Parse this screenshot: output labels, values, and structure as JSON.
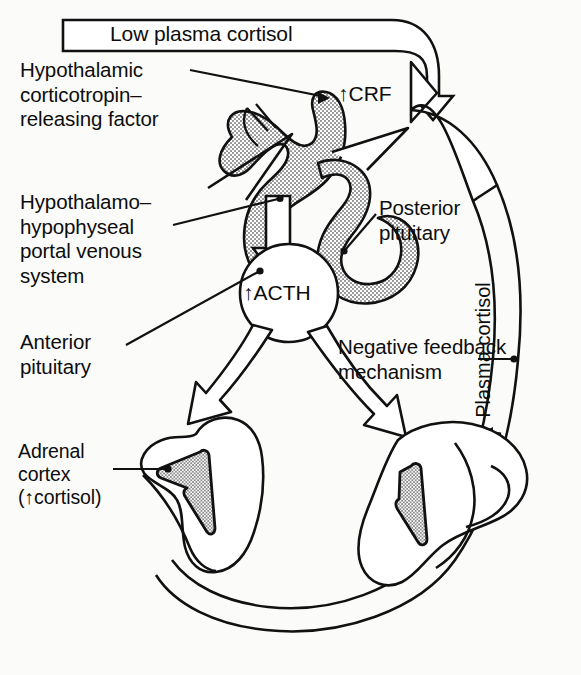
{
  "figure": {
    "background_color": "#fbfbf9",
    "ink_color": "#111111",
    "stipple_fill_color": "#c8c8c8"
  },
  "banner": {
    "text": "Low plasma cortisol",
    "shape": "open-rectangle-into-hollow-arrow",
    "points_to": "CRF"
  },
  "labels": {
    "hypothalamic_crf": "Hypothalamic\ncorticotropin–\nreleasing factor",
    "portal_system": "Hypothalamo–\nhypophyseal\nportal venous\nsystem",
    "anterior_pituitary": "Anterior\npituitary",
    "posterior_pituitary": "Posterior\npituitary",
    "adrenal_cortex": "Adrenal\ncortex\n(↑cortisol)",
    "negative_feedback": "Negative feedback\nmechanism",
    "plasma_cortisol": "Plasma cortisol"
  },
  "inline_labels": {
    "crf": "↑CRF",
    "acth": "↑ACTH"
  },
  "structures": [
    {
      "name": "hypothalamus",
      "fill": "stipple-gray",
      "note": "upper branching gray stippled structure"
    },
    {
      "name": "posterior-pituitary",
      "fill": "stipple-gray",
      "note": "gray stippled lobe right of anterior pituitary"
    },
    {
      "name": "anterior-pituitary",
      "fill": "white",
      "note": "white circle containing the ACTH label"
    },
    {
      "name": "adrenal-gland-left",
      "fill": "white",
      "note": "contains stippled triangular cortex"
    },
    {
      "name": "adrenal-gland-right",
      "fill": "white",
      "note": "contains stippled triangular cortex"
    }
  ],
  "arrows": [
    {
      "name": "low-cortisol-to-crf",
      "style": "hollow",
      "from": "banner",
      "to": "CRF"
    },
    {
      "name": "feedback-return-arrow",
      "style": "hollow-curved",
      "from": "plasma-cortisol-band",
      "to": "CRF"
    },
    {
      "name": "crf-to-anterior-pituitary",
      "style": "hollow",
      "from": "hypothalamus",
      "to": "anterior pituitary"
    },
    {
      "name": "acth-to-left-adrenal",
      "style": "hollow",
      "from": "anterior pituitary",
      "to": "left adrenal"
    },
    {
      "name": "acth-to-right-adrenal",
      "style": "hollow",
      "from": "anterior pituitary",
      "to": "right adrenal"
    },
    {
      "name": "plasma-cortisol-flow-arrow",
      "style": "solid-small",
      "direction": "up-along-band"
    }
  ],
  "leader_lines": [
    {
      "name": "leader-hypothalamic",
      "to": "hypothalamus"
    },
    {
      "name": "leader-portal",
      "to": "portal venous system"
    },
    {
      "name": "leader-anterior",
      "to": "anterior pituitary"
    },
    {
      "name": "leader-posterior",
      "to": "posterior pituitary"
    },
    {
      "name": "leader-adrenal",
      "to": "adrenal cortex"
    },
    {
      "name": "leader-negative-feedback",
      "to": "plasma cortisol band"
    }
  ],
  "caption": ""
}
